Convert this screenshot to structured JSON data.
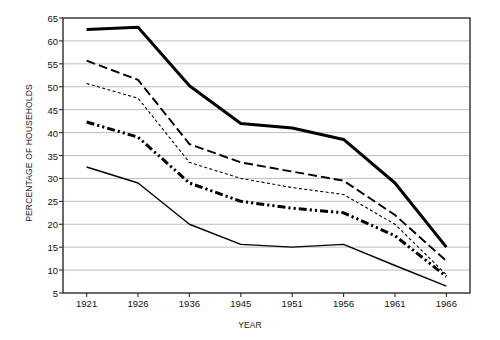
{
  "chart_data": {
    "type": "line",
    "title": "",
    "xlabel": "YEAR",
    "ylabel": "PERCENTAGE OF HOUSEHOLDS",
    "categories": [
      "1921",
      "1926",
      "1936",
      "1945",
      "1951",
      "1956",
      "1961",
      "1966"
    ],
    "ylim": [
      5,
      65
    ],
    "ytick_step": 5,
    "yticks": [
      "65",
      "60",
      "55",
      "50",
      "45",
      "40",
      "35",
      "30",
      "25",
      "20",
      "15",
      "10",
      "5"
    ],
    "grid": "horizontal",
    "legend": "inline-labels",
    "series": [
      {
        "name": "OTHER TOWNS",
        "style": "solid-thick",
        "color": "#000000",
        "values": [
          62.5,
          63.0,
          50.2,
          42.0,
          41.0,
          38.5,
          29.0,
          15.0
        ]
      },
      {
        "name": "LARGE TOWNS",
        "style": "dashed",
        "color": "#000000",
        "values": [
          55.7,
          51.5,
          37.5,
          33.5,
          31.5,
          29.5,
          22.0,
          12.0
        ]
      },
      {
        "name": "OTHER CITIES",
        "style": "dotted-fine",
        "color": "#000000",
        "values": [
          50.7,
          47.5,
          33.5,
          30.0,
          28.0,
          26.5,
          20.0,
          9.0
        ]
      },
      {
        "name": "TOTAL URBAN",
        "style": "dash-dot-dot-thick",
        "color": "#000000",
        "values": [
          42.3,
          39.0,
          29.0,
          25.0,
          23.5,
          22.5,
          17.5,
          8.6
        ]
      },
      {
        "name": "FOUR MAIN CENTRES",
        "style": "solid-thin",
        "color": "#000000",
        "values": [
          32.5,
          29.0,
          20.0,
          15.6,
          15.0,
          15.6,
          11.0,
          6.5
        ]
      }
    ],
    "series_label_positions": [
      {
        "name": "OTHER TOWNS",
        "x": 1945,
        "y": 42.5
      },
      {
        "name": "LARGE TOWNS",
        "x": 1952,
        "y": 32.0
      },
      {
        "name": "OTHER CITIES",
        "x": 1952,
        "y": 26.5
      },
      {
        "name": "TOTAL URBAN",
        "x": 1953,
        "y": 22.5
      },
      {
        "name": "FOUR MAIN CENTRES",
        "x": 1949,
        "y": 18.0
      }
    ]
  }
}
